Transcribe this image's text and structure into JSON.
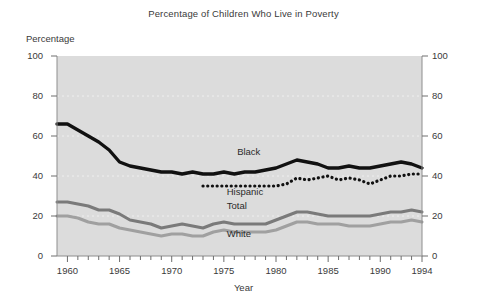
{
  "chart_data": {
    "type": "line",
    "title": "Percentage of Children Who Live in Poverty",
    "xlabel": "Year",
    "ylabel": "Percentage",
    "ylabel_position": "top-left",
    "xlim": [
      1959,
      1994
    ],
    "ylim": [
      0,
      100
    ],
    "yticks": [
      0,
      20,
      40,
      60,
      80,
      100
    ],
    "yticks_right": [
      0,
      20,
      40,
      60,
      80,
      100
    ],
    "xticks": [
      1960,
      1965,
      1970,
      1975,
      1980,
      1985,
      1990,
      1994
    ],
    "minor_xticks_every": 1,
    "grid": "horizontal dotted at 20,40,60,80",
    "legend_position": "inline-labels",
    "plot_background": "#dcdcdc",
    "series": [
      {
        "name": "Black",
        "style": "solid",
        "color": "#111111",
        "label_x": 1978,
        "label_y": 52,
        "x": [
          1959,
          1960,
          1961,
          1962,
          1963,
          1964,
          1965,
          1966,
          1967,
          1968,
          1969,
          1970,
          1971,
          1972,
          1973,
          1974,
          1975,
          1976,
          1977,
          1978,
          1979,
          1980,
          1981,
          1982,
          1983,
          1984,
          1985,
          1986,
          1987,
          1988,
          1989,
          1990,
          1991,
          1992,
          1993,
          1994
        ],
        "values": [
          66,
          66,
          63,
          60,
          57,
          53,
          47,
          45,
          44,
          43,
          42,
          42,
          41,
          42,
          41,
          41,
          42,
          41,
          42,
          42,
          43,
          44,
          46,
          48,
          47,
          46,
          44,
          44,
          45,
          44,
          44,
          45,
          46,
          47,
          46,
          44
        ]
      },
      {
        "name": "Hispanic",
        "style": "dotted",
        "color": "#111111",
        "label_x": 1977,
        "label_y": 32,
        "x": [
          1973,
          1974,
          1975,
          1976,
          1977,
          1978,
          1979,
          1980,
          1981,
          1982,
          1983,
          1984,
          1985,
          1986,
          1987,
          1988,
          1989,
          1990,
          1991,
          1992,
          1993,
          1994
        ],
        "values": [
          35,
          35,
          35,
          35,
          35,
          35,
          35,
          35,
          36,
          39,
          38,
          39,
          40,
          38,
          39,
          38,
          36,
          38,
          40,
          40,
          41,
          41
        ]
      },
      {
        "name": "Total",
        "style": "solid",
        "color": "#7a7a7a",
        "label_x": 1977,
        "label_y": 25,
        "x": [
          1959,
          1960,
          1961,
          1962,
          1963,
          1964,
          1965,
          1966,
          1967,
          1968,
          1969,
          1970,
          1971,
          1972,
          1973,
          1974,
          1975,
          1976,
          1977,
          1978,
          1979,
          1980,
          1981,
          1982,
          1983,
          1984,
          1985,
          1986,
          1987,
          1988,
          1989,
          1990,
          1991,
          1992,
          1993,
          1994
        ],
        "values": [
          27,
          27,
          26,
          25,
          23,
          23,
          21,
          18,
          17,
          16,
          14,
          15,
          16,
          15,
          14,
          16,
          17,
          16,
          16,
          16,
          16,
          18,
          20,
          22,
          22,
          21,
          20,
          20,
          20,
          20,
          20,
          21,
          22,
          22,
          23,
          22
        ]
      },
      {
        "name": "White",
        "style": "solid",
        "color": "#a0a0a0",
        "label_x": 1977,
        "label_y": 11,
        "x": [
          1959,
          1960,
          1961,
          1962,
          1963,
          1964,
          1965,
          1966,
          1967,
          1968,
          1969,
          1970,
          1971,
          1972,
          1973,
          1974,
          1975,
          1976,
          1977,
          1978,
          1979,
          1980,
          1981,
          1982,
          1983,
          1984,
          1985,
          1986,
          1987,
          1988,
          1989,
          1990,
          1991,
          1992,
          1993,
          1994
        ],
        "values": [
          20,
          20,
          19,
          17,
          16,
          16,
          14,
          13,
          12,
          11,
          10,
          11,
          11,
          10,
          10,
          12,
          13,
          12,
          12,
          12,
          12,
          13,
          15,
          17,
          17,
          16,
          16,
          16,
          15,
          15,
          15,
          16,
          17,
          17,
          18,
          17
        ]
      }
    ]
  },
  "axis": {
    "y_left_labels": [
      "100",
      "80",
      "60",
      "40",
      "20",
      "0"
    ],
    "y_right_labels": [
      "100",
      "80",
      "60",
      "40",
      "20",
      "0"
    ],
    "x_labels": [
      "1960",
      "1965",
      "1970",
      "1975",
      "1980",
      "1985",
      "1990",
      "1994"
    ]
  }
}
